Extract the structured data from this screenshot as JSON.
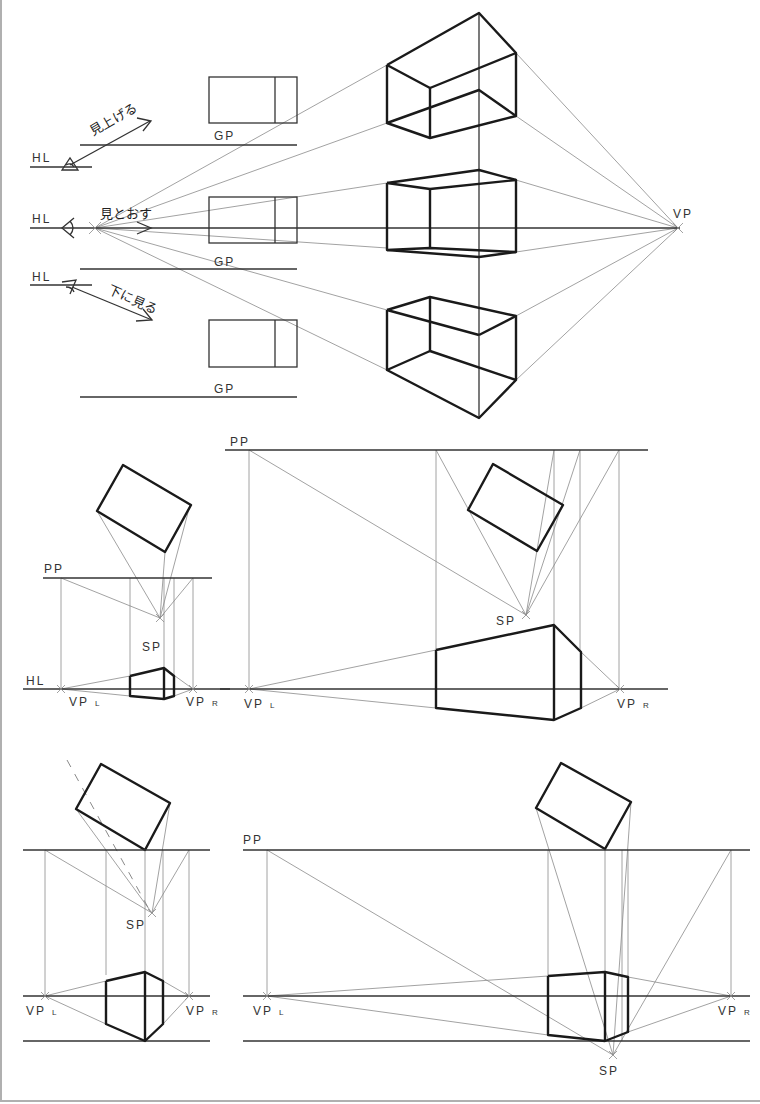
{
  "labels": {
    "hl": "HL",
    "gp": "GP",
    "vp": "VP",
    "pp": "PP",
    "sp": "SP",
    "vp_base": "VP",
    "vpl_sub": "L",
    "vpr_sub": "R"
  },
  "section1": {
    "name": "one-point perspective (eye levels)",
    "look_up": "見上げる",
    "look_through": "見とおす",
    "look_down": "下に見る"
  },
  "section2": {
    "name": "two-point perspective, eye level view"
  },
  "section3": {
    "name": "two-point perspective, looking down view"
  },
  "colors": {
    "bold_line": "#1a1a1a",
    "construction_line": "#8a8a8a",
    "label": "#333333"
  }
}
